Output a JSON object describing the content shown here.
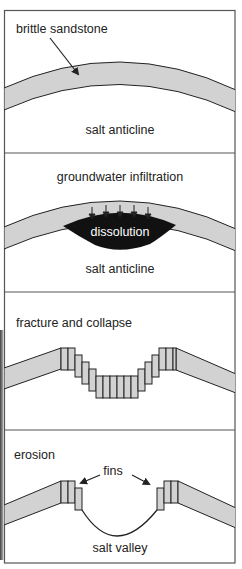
{
  "colors": {
    "layer_fill": "#d2d2d2",
    "outline": "#222222",
    "frame": "#555555",
    "dissolution_fill": "#111111",
    "background": "#ffffff"
  },
  "panels": [
    {
      "id": "panel-1",
      "stage_label": "",
      "callout_label": "brittle sandstone",
      "bottom_label": "salt anticline"
    },
    {
      "id": "panel-2",
      "stage_label": "groundwater infiltration",
      "inner_label": "dissolution",
      "bottom_label": "salt anticline",
      "arrow_count": 5
    },
    {
      "id": "panel-3",
      "stage_label": "fracture and collapse"
    },
    {
      "id": "panel-4",
      "stage_label": "erosion",
      "callout_label": "fins",
      "bottom_label": "salt valley"
    }
  ]
}
